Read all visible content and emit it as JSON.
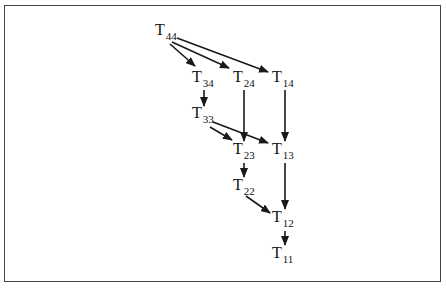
{
  "diagram": {
    "title": "",
    "nodes": [
      {
        "id": "T44",
        "label": "T",
        "sub": "44",
        "x": 155,
        "y": 22
      },
      {
        "id": "T34",
        "label": "T",
        "sub": "34",
        "x": 192,
        "y": 69
      },
      {
        "id": "T24",
        "label": "T",
        "sub": "24",
        "x": 233,
        "y": 69
      },
      {
        "id": "T14",
        "label": "T",
        "sub": "14",
        "x": 272,
        "y": 69
      },
      {
        "id": "T33",
        "label": "T",
        "sub": "33",
        "x": 192,
        "y": 105
      },
      {
        "id": "T23",
        "label": "T",
        "sub": "23",
        "x": 233,
        "y": 141
      },
      {
        "id": "T13",
        "label": "T",
        "sub": "13",
        "x": 272,
        "y": 141
      },
      {
        "id": "T22",
        "label": "T",
        "sub": "22",
        "x": 233,
        "y": 177
      },
      {
        "id": "T12",
        "label": "T",
        "sub": "12",
        "x": 272,
        "y": 209
      },
      {
        "id": "T11",
        "label": "T",
        "sub": "11",
        "x": 272,
        "y": 245
      }
    ],
    "edges": [
      {
        "from": "T44",
        "to": "T34"
      },
      {
        "from": "T44",
        "to": "T24"
      },
      {
        "from": "T44",
        "to": "T14"
      },
      {
        "from": "T34",
        "to": "T33"
      },
      {
        "from": "T24",
        "to": "T23"
      },
      {
        "from": "T14",
        "to": "T13"
      },
      {
        "from": "T33",
        "to": "T23"
      },
      {
        "from": "T33",
        "to": "T13"
      },
      {
        "from": "T23",
        "to": "T22"
      },
      {
        "from": "T13",
        "to": "T12"
      },
      {
        "from": "T22",
        "to": "T12"
      },
      {
        "from": "T12",
        "to": "T11"
      }
    ],
    "colors": {
      "line": "#1a1a1a",
      "frame": "#444444",
      "background": "#ffffff"
    }
  }
}
